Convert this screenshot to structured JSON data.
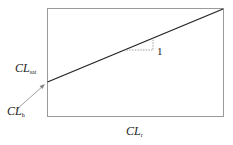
{
  "diagram": {
    "type": "linear-relationship",
    "y_label": {
      "main": "CL",
      "sub": "sat"
    },
    "intercept_label": {
      "main": "CL",
      "sub": "h"
    },
    "x_label": {
      "main": "CL",
      "sub": "r"
    },
    "slope_label": "1",
    "colors": {
      "frame": "#9a9a9a",
      "line": "#222222",
      "slope_triangle": "#888888",
      "arrow": "#888888"
    }
  }
}
